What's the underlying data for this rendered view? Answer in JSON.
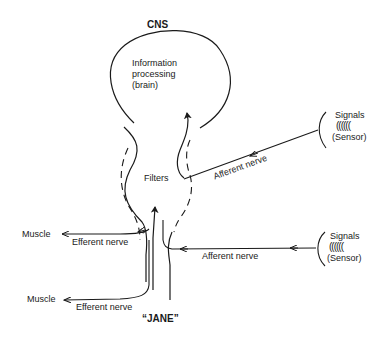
{
  "diagram": {
    "title_top": "CNS",
    "title_bottom": "“JANE”",
    "brain": {
      "line1": "Information",
      "line2": "processing",
      "line3": "(brain)"
    },
    "filters_label": "Filters",
    "sensors": [
      {
        "signals_label": "Signals",
        "waves": "((((((",
        "sensor_label": "(Sensor)",
        "nerve_label": "Afferent nerve"
      },
      {
        "signals_label": "Signals",
        "waves": "((((((",
        "sensor_label": "(Sensor)",
        "nerve_label": "Afferent nerve"
      }
    ],
    "outputs": [
      {
        "target_label": "Muscle",
        "nerve_label": "Efferent nerve"
      },
      {
        "target_label": "Muscle",
        "nerve_label": "Efferent nerve"
      }
    ],
    "colors": {
      "ink": "#1a1a1a",
      "background": "#ffffff"
    }
  }
}
